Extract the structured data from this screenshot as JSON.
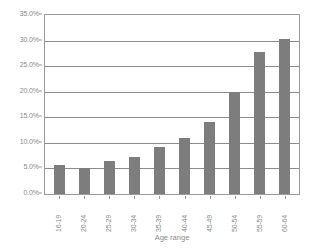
{
  "chart_data": {
    "type": "bar",
    "title": "",
    "xlabel": "Age range",
    "ylabel": "",
    "categories": [
      "16-19",
      "20-24",
      "25-29",
      "30-34",
      "35-39",
      "40-44",
      "45-49",
      "50-54",
      "55-59",
      "60-64"
    ],
    "values": [
      5.7,
      5.1,
      6.4,
      7.3,
      9.2,
      11.0,
      14.1,
      20.0,
      27.8,
      30.3
    ],
    "value_suffix": "%",
    "ylim": [
      0,
      35
    ],
    "y_tick_labels": [
      "0.0%",
      "5.0%",
      "10.0%",
      "15.0%",
      "20.0%",
      "25.0%",
      "30.0%",
      "35.0%"
    ],
    "y_tick_values": [
      0,
      5,
      10,
      15,
      20,
      25,
      30,
      35
    ],
    "grid": "horizontal",
    "legend": "none",
    "bar_color": "#7d7d7d",
    "grid_color": "#8c8c8c",
    "axis_color": "#9a9a9a",
    "text_color": "#8a8a8a",
    "background": "#ffffff"
  }
}
